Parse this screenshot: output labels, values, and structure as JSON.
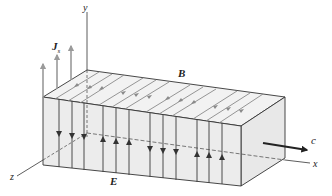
{
  "figure": {
    "labels": {
      "y_axis": "y",
      "x_axis": "x",
      "z_axis": "z",
      "magnetic_field": "B",
      "electric_field": "E",
      "surface_current": "J",
      "surface_current_sub": "s",
      "velocity": "c"
    },
    "colors": {
      "block_front": "#ececec",
      "block_top": "#f2f2f2",
      "block_side": "#e6e6e6",
      "edge": "#333333",
      "field_line_top": "#8a8a8a",
      "current_arrow": "#9a9a9a",
      "e_line": "#3a3a3a",
      "velocity_arrow": "#222222"
    },
    "e_field_lines": [
      {
        "x": 59,
        "dir": "down"
      },
      {
        "x": 72,
        "dir": "down"
      },
      {
        "x": 84,
        "dir": "down"
      },
      {
        "x": 103,
        "dir": "up"
      },
      {
        "x": 116,
        "dir": "up"
      },
      {
        "x": 129,
        "dir": "up"
      },
      {
        "x": 150,
        "dir": "down"
      },
      {
        "x": 163,
        "dir": "down"
      },
      {
        "x": 176,
        "dir": "down"
      },
      {
        "x": 197,
        "dir": "up"
      },
      {
        "x": 209,
        "dir": "up"
      },
      {
        "x": 222,
        "dir": "up"
      }
    ]
  }
}
